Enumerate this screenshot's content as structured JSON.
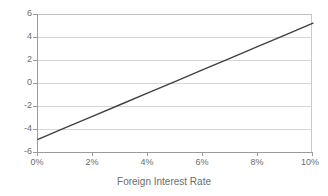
{
  "chart_data": {
    "type": "line",
    "title": "",
    "subtitle": "",
    "xlabel": "Foreign Interest Rate",
    "ylabel": "",
    "xlim": [
      0,
      10
    ],
    "ylim": [
      -6,
      6
    ],
    "xticks": [
      0,
      2,
      4,
      6,
      8,
      10
    ],
    "xticklabels": [
      "0%",
      "2%",
      "4%",
      "6%",
      "8%",
      "10%"
    ],
    "yticks": [
      6,
      4,
      2,
      0,
      -2,
      -4,
      -6
    ],
    "yticklabels": [
      "6",
      "4",
      "2",
      "0",
      "-2",
      "-4",
      "-6"
    ],
    "grid": "horizontal",
    "legend": "none",
    "series": [
      {
        "name": "",
        "color": "#404040",
        "linewidth": 1.4,
        "x": [
          0,
          1,
          2,
          3,
          4,
          5,
          6,
          7,
          8,
          9,
          10
        ],
        "values": [
          -4.9,
          -3.89,
          -2.88,
          -1.87,
          -0.86,
          0.15,
          1.16,
          2.17,
          3.18,
          4.19,
          5.2
        ]
      }
    ],
    "annotations": []
  },
  "style": {
    "background": "#ffffff",
    "grid_color": "#d6d6d6",
    "axis_color": "#9a9a9a",
    "text_color": "#6d6d6d",
    "line_color": "#404040"
  }
}
